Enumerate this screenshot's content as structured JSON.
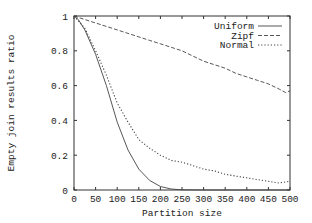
{
  "chart_data": {
    "type": "line",
    "title": "",
    "xlabel": "Partition size",
    "ylabel": "Empty join results ratio",
    "xlim": [
      0,
      500
    ],
    "ylim": [
      0,
      1
    ],
    "grid": false,
    "legend_position": "top-right",
    "x_ticks": [
      "0",
      "50",
      "100",
      "150",
      "200",
      "250",
      "300",
      "350",
      "400",
      "450",
      "500"
    ],
    "y_ticks": [
      "0",
      "0.2",
      "0.4",
      "0.6",
      "0.8",
      "1"
    ],
    "series": [
      {
        "name": "Uniform",
        "style": "solid",
        "x": [
          0,
          10,
          25,
          50,
          75,
          100,
          125,
          150,
          175,
          200,
          225,
          250,
          300,
          350,
          400,
          450,
          500
        ],
        "values": [
          1.0,
          0.98,
          0.92,
          0.78,
          0.6,
          0.39,
          0.23,
          0.12,
          0.055,
          0.02,
          0.006,
          0.001,
          0,
          0,
          0,
          0,
          0
        ]
      },
      {
        "name": "Zipf",
        "style": "dashed",
        "x": [
          0,
          25,
          50,
          75,
          100,
          125,
          150,
          175,
          200,
          225,
          250,
          275,
          300,
          325,
          350,
          375,
          400,
          425,
          450,
          475,
          490,
          500
        ],
        "values": [
          1.0,
          0.98,
          0.96,
          0.94,
          0.92,
          0.9,
          0.88,
          0.86,
          0.84,
          0.82,
          0.8,
          0.77,
          0.74,
          0.72,
          0.7,
          0.67,
          0.65,
          0.63,
          0.61,
          0.58,
          0.56,
          0.57
        ]
      },
      {
        "name": "Normal",
        "style": "dotted",
        "x": [
          0,
          25,
          50,
          75,
          100,
          125,
          150,
          175,
          200,
          225,
          250,
          275,
          300,
          325,
          350,
          375,
          400,
          425,
          450,
          475,
          500
        ],
        "values": [
          1.0,
          0.93,
          0.8,
          0.66,
          0.5,
          0.39,
          0.29,
          0.24,
          0.2,
          0.17,
          0.16,
          0.14,
          0.12,
          0.11,
          0.09,
          0.08,
          0.07,
          0.06,
          0.05,
          0.04,
          0.05
        ]
      }
    ]
  },
  "legend": {
    "entries": [
      "Uniform",
      "Zipf",
      "Normal"
    ]
  },
  "colors": {
    "axis": "#333333",
    "line": "#444444",
    "background": "#ffffff"
  }
}
